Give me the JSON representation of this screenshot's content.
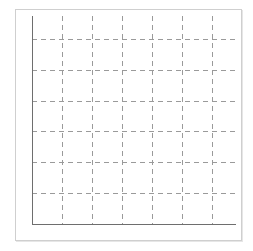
{
  "chart_data": {
    "type": "line",
    "title": "",
    "xlabel": "",
    "ylabel": "",
    "categories": [],
    "series": [],
    "x_tick_labels": [],
    "y_tick_labels": [],
    "grid": true,
    "grid_style": "dashed",
    "legend": null,
    "layout": {
      "plot_left": 32,
      "plot_top": 16,
      "plot_right": 236,
      "plot_bottom": 224,
      "vertical_gridlines_x": [
        62,
        92,
        122,
        152,
        182,
        212
      ],
      "horizontal_gridlines_y": [
        39,
        70,
        101,
        131,
        162,
        193
      ]
    },
    "colors": {
      "axis": "#6e6e6e",
      "grid": "#9a9a9a",
      "frame": "#cfcfcf",
      "background": "#ffffff"
    }
  }
}
